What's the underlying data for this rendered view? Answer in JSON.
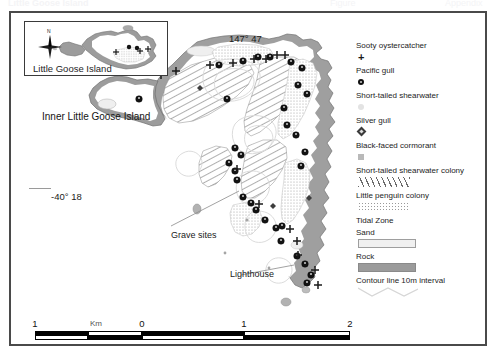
{
  "figure": {
    "type": "map",
    "title_strip": {
      "left_fragment": "Little Goose Island",
      "mid_fragment": "Figure",
      "right_fragment": "Appendix"
    }
  },
  "inset": {
    "label": "Little Goose Island",
    "compass_label": "N",
    "compass_icon": "compass-star-icon"
  },
  "map": {
    "outer_island_label": "Inner Little Goose Island",
    "longitude_label": "147° 47",
    "latitude_label": "-40° 18",
    "annotations": [
      {
        "label": "Grave sites"
      },
      {
        "label": "Lighthouse"
      }
    ]
  },
  "scalebar": {
    "unit_label": "Km",
    "ticks": [
      "1",
      "0",
      "1",
      "2"
    ]
  },
  "legend": {
    "items": [
      {
        "label": "Sooty oystercatcher",
        "symbol": "cross-marker-icon"
      },
      {
        "label": "Pacific gull",
        "symbol": "filled-circle-marker-icon"
      },
      {
        "label": "Short-tailed shearwater",
        "symbol": "pale-circle-marker-icon"
      },
      {
        "label": "Silver gull",
        "symbol": "diamond-marker-icon"
      },
      {
        "label": "Black-faced cormorant",
        "symbol": "grey-square-marker-icon"
      },
      {
        "label": "Short-tailed shearwater colony",
        "symbol": "diagonal-hatch-swatch-icon"
      },
      {
        "label": "Little penguin colony",
        "symbol": "stipple-dot-swatch-icon"
      },
      {
        "label": "Tidal Zone",
        "symbol": "none"
      },
      {
        "label": "Sand",
        "symbol": "sand-swatch-icon"
      },
      {
        "label": "Rock",
        "symbol": "rock-swatch-icon"
      },
      {
        "label": "Contour line 10m interval",
        "symbol": "contour-line-icon"
      }
    ]
  },
  "colors": {
    "frame": "#4a4a4a",
    "rock": "#9b9b9b",
    "sand": "#f0f0f0",
    "hatch": "#6a6a6a",
    "stipple": "#9a9a9a",
    "contour": "#d8d8d8",
    "marker_dark": "#111111"
  }
}
